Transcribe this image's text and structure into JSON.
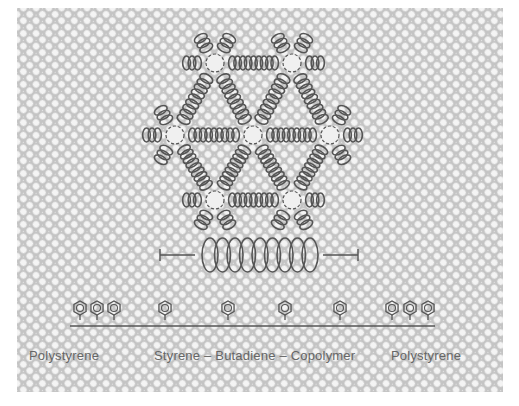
{
  "figure": {
    "type": "schematic",
    "colors": {
      "background": "#ffffff",
      "pattern_light": "#f2f2f2",
      "pattern_dark": "#bdbdbd",
      "ink": "#555555"
    },
    "network": {
      "nodes": [
        {
          "x": 215,
          "y": 63
        },
        {
          "x": 292,
          "y": 63
        },
        {
          "x": 175,
          "y": 135
        },
        {
          "x": 253,
          "y": 135
        },
        {
          "x": 330,
          "y": 135
        },
        {
          "x": 215,
          "y": 200
        },
        {
          "x": 292,
          "y": 200
        }
      ]
    },
    "spring_symbol": {
      "coils": 9
    },
    "chain": {
      "styrene_groups": [
        {
          "type": "block",
          "count": 3
        },
        {
          "type": "single",
          "count": 1
        },
        {
          "type": "single",
          "count": 1
        },
        {
          "type": "single",
          "count": 1
        },
        {
          "type": "single",
          "count": 1
        },
        {
          "type": "block",
          "count": 3
        }
      ]
    },
    "labels": {
      "left": "Polystyrene",
      "center": "Styrene – Butadiene – Copolymer",
      "right": "Polystyrene"
    }
  }
}
